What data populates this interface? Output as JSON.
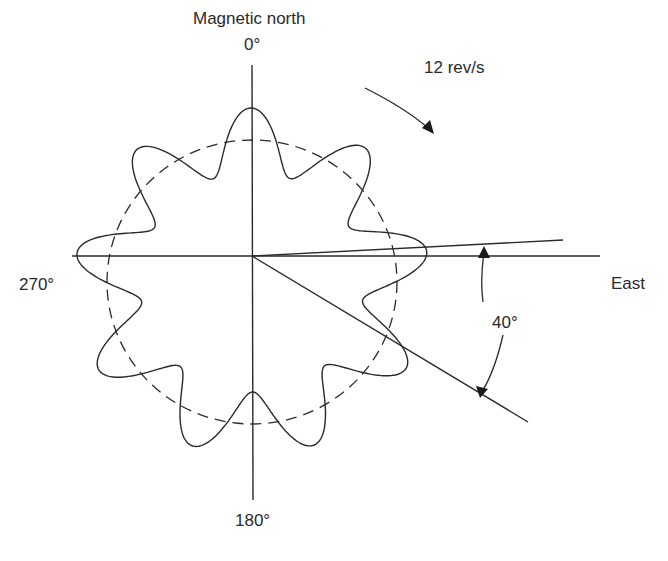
{
  "labels": {
    "north_title": "Magnetic north",
    "north_angle": "0°",
    "rotation": "12 rev/s",
    "west_angle": "270°",
    "east": "East",
    "span_angle": "40°",
    "south_angle": "180°"
  },
  "geometry": {
    "center": [
      252,
      256
    ],
    "dashed_circle_radius": 144,
    "lobes": 9,
    "lobe_amplitude": 32,
    "ray_upper_deg_above_east": 3,
    "ray_lower_deg_below_east": 31
  },
  "colors": {
    "line": "#2a2a2a",
    "background": "#ffffff"
  }
}
